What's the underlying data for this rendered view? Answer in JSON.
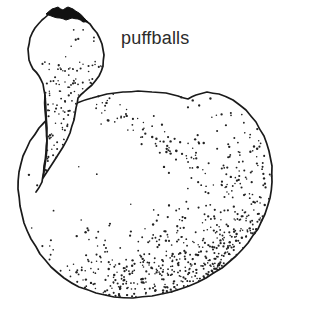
{
  "figure": {
    "title": "puffballs",
    "medium": "black-and-white stippled line drawing",
    "background_color": "#ffffff",
    "ink_color": "#1a1a1a",
    "stipple_color": "#222222",
    "width": 283,
    "height": 312
  },
  "caption": {
    "text": "puffballs",
    "color": "#2b2b2b",
    "font_size_px": 18,
    "x": 121,
    "y": 28
  },
  "subjects": [
    {
      "id": "small-puffball",
      "label": "small puffball with open apical pore and tapering stalk",
      "apex_pore_color": "#111111",
      "stipple_region": "lower-right of head and along stalk"
    },
    {
      "id": "large-puffball",
      "label": "large rounded puffball body",
      "stipple_region": "right flank and bottom edge, fading toward upper-left"
    }
  ],
  "chart_data": {
    "type": "scatter",
    "title": "puffballs",
    "xlabel": "",
    "ylabel": "",
    "legend": [],
    "annotations": [
      "puffballs"
    ],
    "grid": false,
    "xlim": [
      0,
      283
    ],
    "ylim": [
      0,
      312
    ],
    "series": [
      {
        "name": "small-puffball-outline",
        "kind": "closed-path",
        "points": [
          [
            49,
            14
          ],
          [
            42,
            20
          ],
          [
            35,
            28
          ],
          [
            30,
            38
          ],
          [
            28,
            49
          ],
          [
            29,
            60
          ],
          [
            33,
            69
          ],
          [
            39,
            76
          ],
          [
            43,
            84
          ],
          [
            45,
            95
          ],
          [
            45,
            110
          ],
          [
            46,
            126
          ],
          [
            47,
            140
          ],
          [
            46,
            152
          ],
          [
            44,
            166
          ],
          [
            43,
            178
          ],
          [
            63,
            147
          ],
          [
            70,
            133
          ],
          [
            74,
            120
          ],
          [
            76,
            108
          ],
          [
            78,
            98
          ],
          [
            84,
            92
          ],
          [
            92,
            85
          ],
          [
            99,
            76
          ],
          [
            103,
            66
          ],
          [
            104,
            55
          ],
          [
            102,
            44
          ],
          [
            97,
            33
          ],
          [
            90,
            24
          ],
          [
            81,
            17
          ],
          [
            70,
            13
          ],
          [
            59,
            12
          ]
        ]
      },
      {
        "name": "small-puffball-pore",
        "kind": "filled-blob",
        "points": [
          [
            46,
            14
          ],
          [
            52,
            9
          ],
          [
            58,
            7
          ],
          [
            63,
            10
          ],
          [
            68,
            7
          ],
          [
            73,
            9
          ],
          [
            79,
            13
          ],
          [
            84,
            18
          ],
          [
            88,
            22
          ],
          [
            83,
            22
          ],
          [
            78,
            19
          ],
          [
            72,
            18
          ],
          [
            66,
            20
          ],
          [
            60,
            18
          ],
          [
            54,
            17
          ]
        ]
      },
      {
        "name": "large-puffball-outline",
        "kind": "closed-path",
        "points": [
          [
            152,
            92
          ],
          [
            166,
            93
          ],
          [
            178,
            96
          ],
          [
            188,
            99
          ],
          [
            196,
            95
          ],
          [
            207,
            92
          ],
          [
            219,
            94
          ],
          [
            233,
            100
          ],
          [
            246,
            110
          ],
          [
            256,
            122
          ],
          [
            264,
            136
          ],
          [
            269,
            151
          ],
          [
            272,
            166
          ],
          [
            272,
            182
          ],
          [
            270,
            198
          ],
          [
            265,
            214
          ],
          [
            258,
            229
          ],
          [
            248,
            243
          ],
          [
            236,
            256
          ],
          [
            222,
            268
          ],
          [
            206,
            278
          ],
          [
            189,
            286
          ],
          [
            171,
            292
          ],
          [
            152,
            296
          ],
          [
            133,
            298
          ],
          [
            114,
            297
          ],
          [
            96,
            293
          ],
          [
            79,
            287
          ],
          [
            64,
            278
          ],
          [
            51,
            267
          ],
          [
            40,
            254
          ],
          [
            31,
            239
          ],
          [
            24,
            223
          ],
          [
            20,
            206
          ],
          [
            18,
            189
          ],
          [
            19,
            172
          ],
          [
            23,
            156
          ],
          [
            30,
            141
          ],
          [
            39,
            128
          ],
          [
            50,
            117
          ],
          [
            63,
            109
          ],
          [
            77,
            103
          ],
          [
            92,
            98
          ],
          [
            107,
            94
          ],
          [
            123,
            92
          ],
          [
            138,
            91
          ]
        ]
      },
      {
        "name": "stalk-left-edge",
        "kind": "open-path",
        "points": [
          [
            45,
            95
          ],
          [
            46,
            112
          ],
          [
            47,
            128
          ],
          [
            47,
            143
          ],
          [
            46,
            158
          ],
          [
            44,
            172
          ],
          [
            42,
            182
          ],
          [
            36,
            192
          ]
        ]
      }
    ],
    "stipple_fields": [
      {
        "name": "small-puffball-shading",
        "description": "dots clustered on lower right of head and down the stalk",
        "count": 120
      },
      {
        "name": "large-puffball-shading",
        "description": "dense dots along right flank and bottom rim, sparse toward upper left",
        "count": 700
      }
    ]
  }
}
